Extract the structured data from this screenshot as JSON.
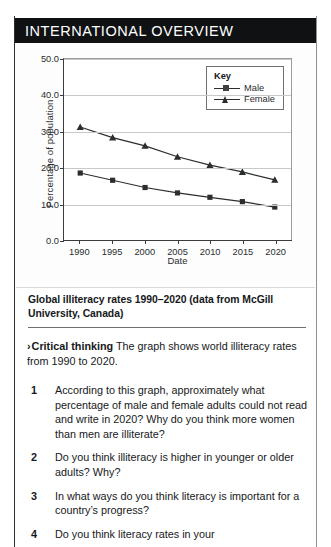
{
  "header": {
    "title": "INTERNATIONAL OVERVIEW"
  },
  "chart_data": {
    "type": "line",
    "title": "",
    "xlabel": "Date",
    "ylabel": "Percentage of population",
    "categories": [
      "1990",
      "1995",
      "2000",
      "2005",
      "2010",
      "2015",
      "2020"
    ],
    "x": [
      1990,
      1995,
      2000,
      2005,
      2010,
      2015,
      2020
    ],
    "series": [
      {
        "name": "Male",
        "marker": "square",
        "values": [
          18.5,
          16.5,
          14.5,
          13.0,
          11.8,
          10.6,
          9.1
        ]
      },
      {
        "name": "Female",
        "marker": "triangle",
        "values": [
          31.2,
          28.3,
          26.0,
          23.0,
          20.7,
          18.8,
          16.6
        ]
      }
    ],
    "ylim": [
      0.0,
      50.0
    ],
    "yticks": [
      "0.0",
      "10.0",
      "20.0",
      "30.0",
      "40.0",
      "50.0"
    ],
    "ytick_values": [
      0.0,
      10.0,
      20.0,
      30.0,
      40.0,
      50.0
    ],
    "grid": true,
    "legend_position": "top-right",
    "legend_title": "Key",
    "line_color": "#2b2d2f"
  },
  "caption": {
    "text": "Global illiteracy rates 1990–2020 (data from McGill University, Canada)"
  },
  "critical_thinking": {
    "chevron": "›",
    "lead": "Critical thinking",
    "body": " The graph shows world illiteracy rates from 1990 to 2020."
  },
  "questions": [
    {
      "number": "1",
      "text": "According to this graph, approximately what percentage of male and female adults could not read and write in 2020? Why do you think more women than men are illiterate?"
    },
    {
      "number": "2",
      "text": "Do you think illiteracy is higher in younger or older adults? Why?"
    },
    {
      "number": "3",
      "text": "In what ways do you think literacy is important for a country’s progress?"
    },
    {
      "number": "4",
      "text": "Do you think literacy rates in your"
    }
  ]
}
